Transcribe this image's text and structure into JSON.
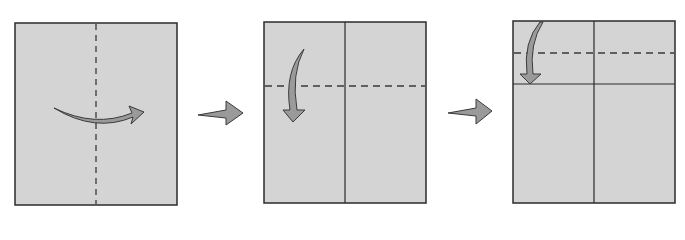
{
  "diagram": {
    "title": "",
    "type": "origami-fold-sequence",
    "colors": {
      "paper": "#d4d4d4",
      "outline": "#2b2b2b",
      "arrow_fill": "#9a9a9a",
      "arrow_stroke": "#3a3a3a",
      "dash": "#3a3a3a"
    },
    "steps": [
      {
        "step": 1,
        "label": "Fold in half along vertical valley fold",
        "fold": "vertical-dashed",
        "arrow": "left-to-right"
      },
      {
        "step": 2,
        "label": "Fold top edge down along horizontal valley fold",
        "fold": "horizontal-dashed",
        "arrow": "top-down"
      },
      {
        "step": 3,
        "label": "Fold top edge down again to the crease",
        "fold": "horizontal-dashed",
        "arrow": "top-down"
      }
    ],
    "transitions": [
      "next-step-arrow",
      "next-step-arrow"
    ]
  }
}
